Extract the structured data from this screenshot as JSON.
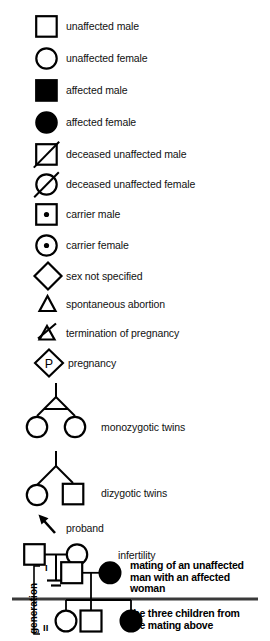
{
  "document": {
    "type": "pedigree-symbol-legend",
    "title": "Pedigree symbols legend",
    "background_color": "#ffffff",
    "ink_color": "#000000"
  },
  "legend": {
    "entries": [
      {
        "id": "unaffected-male",
        "symbol": "square-open",
        "label": "unaffected male"
      },
      {
        "id": "unaffected-female",
        "symbol": "circle-open",
        "label": "unaffected female"
      },
      {
        "id": "affected-male",
        "symbol": "square-filled",
        "label": "affected male"
      },
      {
        "id": "affected-female",
        "symbol": "circle-filled",
        "label": "affected female"
      },
      {
        "id": "deceased-unaffected-male",
        "symbol": "square-open-slashed",
        "label": "deceased unaffected male"
      },
      {
        "id": "deceased-unaffected-female",
        "symbol": "circle-open-slashed",
        "label": "deceased unaffected female"
      },
      {
        "id": "carrier-male",
        "symbol": "square-dot",
        "label": "carrier male"
      },
      {
        "id": "carrier-female",
        "symbol": "circle-dot",
        "label": "carrier female"
      },
      {
        "id": "sex-not-specified",
        "symbol": "diamond-open",
        "label": "sex not specified"
      },
      {
        "id": "spontaneous-abortion",
        "symbol": "small-triangle",
        "label": "spontaneous abortion"
      },
      {
        "id": "termination-of-pregnancy",
        "symbol": "small-triangle-slashed",
        "label": "termination of pregnancy"
      },
      {
        "id": "pregnancy",
        "symbol": "diamond-p",
        "label": "pregnancy",
        "inner_text": "P"
      },
      {
        "id": "monozygotic-twins",
        "symbol": "twins-monozygotic",
        "label": "monozygotic twins"
      },
      {
        "id": "dizygotic-twins",
        "symbol": "twins-dizygotic",
        "label": "dizygotic twins"
      },
      {
        "id": "proband",
        "symbol": "arrow-up-left",
        "label": "proband"
      },
      {
        "id": "infertility",
        "symbol": "mating-ground",
        "label": "infertility"
      }
    ]
  },
  "example": {
    "generation_axis_label": "generation",
    "generation_rows": [
      {
        "roman": "I"
      },
      {
        "roman": "II"
      }
    ],
    "annotations": [
      {
        "id": "mating-annotation",
        "text": "mating of an unaffected\nman with an affected\nwoman"
      },
      {
        "id": "children-annotation",
        "text": "the three children from\nthe mating above"
      }
    ],
    "individuals": [
      {
        "id": "father",
        "generation": "I",
        "symbol": "square-open"
      },
      {
        "id": "mother",
        "generation": "I",
        "symbol": "circle-filled"
      },
      {
        "id": "child-1",
        "generation": "II",
        "symbol": "circle-open"
      },
      {
        "id": "child-2",
        "generation": "II",
        "symbol": "square-open"
      },
      {
        "id": "child-3",
        "generation": "II",
        "symbol": "circle-filled"
      }
    ]
  }
}
